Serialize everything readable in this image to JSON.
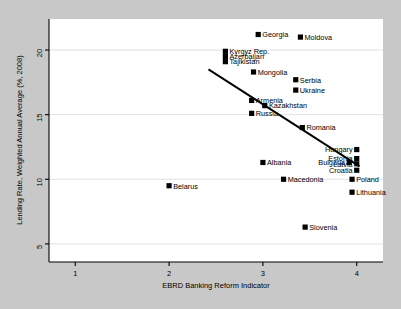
{
  "chart_data": {
    "type": "scatter",
    "title": "",
    "xlabel": "EBRD Banking Reform Indicator",
    "ylabel": "Lending Rate, Weighted Annual Average (%, 2008)",
    "xlim": [
      0.72,
      4.28
    ],
    "ylim": [
      3.6,
      22.4
    ],
    "xticks": [
      "1",
      "2",
      "3",
      "4"
    ],
    "xtick_values": [
      1,
      2,
      3,
      4
    ],
    "yticks": [
      "5",
      "10",
      "15",
      "20"
    ],
    "ytick_values": [
      5,
      10,
      15,
      20
    ],
    "grid": "horizontal",
    "legend": "none",
    "marker": "filled-square",
    "marker_color": "#000000",
    "points": [
      {
        "label": "Georgia",
        "x": 2.95,
        "y": 21.2,
        "label_side": "right"
      },
      {
        "label": "Moldova",
        "x": 3.4,
        "y": 21.0,
        "label_side": "right"
      },
      {
        "label": "Kyrgyz Rep.",
        "x": 2.6,
        "y": 19.9,
        "label_side": "right"
      },
      {
        "label": "Azerbaijan",
        "x": 2.6,
        "y": 19.5,
        "label_side": "right"
      },
      {
        "label": "Tajikistan",
        "x": 2.6,
        "y": 19.1,
        "label_side": "right"
      },
      {
        "label": "Mongolia",
        "x": 2.9,
        "y": 18.3,
        "label_side": "right"
      },
      {
        "label": "Serbia",
        "x": 3.35,
        "y": 17.7,
        "label_side": "right"
      },
      {
        "label": "Ukraine",
        "x": 3.35,
        "y": 16.9,
        "label_side": "right"
      },
      {
        "label": "Armenia",
        "x": 2.88,
        "y": 16.1,
        "label_side": "right"
      },
      {
        "label": "Kazakhstan",
        "x": 3.02,
        "y": 15.7,
        "label_side": "right"
      },
      {
        "label": "Russia",
        "x": 2.88,
        "y": 15.1,
        "label_side": "right"
      },
      {
        "label": "Romania",
        "x": 3.42,
        "y": 14.0,
        "label_side": "right"
      },
      {
        "label": "Hungary",
        "x": 4.0,
        "y": 12.3,
        "label_side": "left"
      },
      {
        "label": "Estonia",
        "x": 4.0,
        "y": 11.6,
        "label_side": "left"
      },
      {
        "label": "Latvia",
        "x": 4.0,
        "y": 11.2,
        "label_side": "left"
      },
      {
        "label": "Croatia",
        "x": 4.0,
        "y": 10.7,
        "label_side": "left"
      },
      {
        "label": "Bulgaria",
        "x": 3.92,
        "y": 11.3,
        "label_side": "left"
      },
      {
        "label": "Albania",
        "x": 3.0,
        "y": 11.3,
        "label_side": "right"
      },
      {
        "label": "Macedonia",
        "x": 3.22,
        "y": 10.0,
        "label_side": "right"
      },
      {
        "label": "Poland",
        "x": 3.95,
        "y": 10.0,
        "label_side": "right"
      },
      {
        "label": "Lithuania",
        "x": 3.95,
        "y": 9.0,
        "label_side": "right"
      },
      {
        "label": "Belarus",
        "x": 2.0,
        "y": 9.5,
        "label_side": "right"
      },
      {
        "label": "Slovenia",
        "x": 3.45,
        "y": 6.3,
        "label_side": "right"
      }
    ],
    "trend_line": {
      "x0": 2.42,
      "y0": 18.5,
      "x1": 4.03,
      "y1": 11.0
    }
  }
}
